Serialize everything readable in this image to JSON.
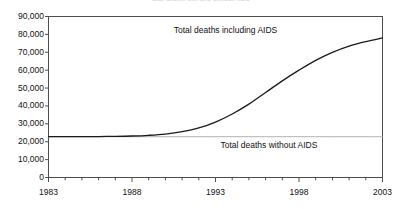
{
  "chart_data": {
    "type": "line",
    "title": "Total deaths with and without AIDS",
    "xlabel": "",
    "ylabel": "",
    "xlim": [
      1983,
      2003
    ],
    "ylim": [
      0,
      90000
    ],
    "grid": false,
    "legend_position": "inline-annotations",
    "x": [
      1983,
      1984,
      1985,
      1986,
      1987,
      1988,
      1989,
      1990,
      1991,
      1992,
      1993,
      1994,
      1995,
      1996,
      1997,
      1998,
      1999,
      2000,
      2001,
      2002,
      2003
    ],
    "series": [
      {
        "name": "Total deaths including AIDS",
        "color": "#1a1a1a",
        "values": [
          22800,
          22800,
          22800,
          22900,
          23000,
          23200,
          23600,
          24300,
          25600,
          27700,
          31000,
          35500,
          41000,
          47500,
          54000,
          60000,
          65500,
          70000,
          73500,
          76000,
          78000
        ]
      },
      {
        "name": "Total deaths without AIDS",
        "color": "#a8a8a8",
        "values": [
          22800,
          22800,
          22800,
          22800,
          22800,
          22800,
          22800,
          22800,
          22800,
          22800,
          22800,
          22800,
          22800,
          22800,
          22800,
          22800,
          22800,
          22800,
          22800,
          22800,
          22800
        ]
      }
    ],
    "y_tick_labels": [
      "90,000",
      "80,000",
      "70,000",
      "60,000",
      "50,000",
      "40,000",
      "30,000",
      "20,000",
      "10,000",
      "0"
    ],
    "y_tick_values": [
      90000,
      80000,
      70000,
      60000,
      50000,
      40000,
      30000,
      20000,
      10000,
      0
    ],
    "x_tick_labels": [
      "1983",
      "1988",
      "1993",
      "1998",
      "2003"
    ],
    "x_tick_values": [
      1983,
      1988,
      1993,
      1998,
      2003
    ],
    "x_minor_tick_values": [
      1983,
      1984,
      1985,
      1986,
      1987,
      1988,
      1989,
      1990,
      1991,
      1992,
      1993,
      1994,
      1995,
      1996,
      1997,
      1998,
      1999,
      2000,
      2001,
      2002,
      2003
    ],
    "annotations": [
      {
        "text": "Total deaths including AIDS",
        "x": 1993.6,
        "y": 82000
      },
      {
        "text": "Total deaths without AIDS",
        "x": 1996.2,
        "y": 17500
      }
    ]
  }
}
